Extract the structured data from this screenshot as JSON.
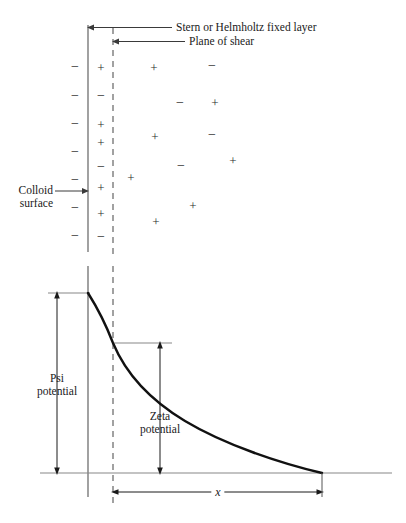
{
  "figure": {
    "title_visible": "",
    "type": "electrical-double-layer-diagram",
    "colors": {
      "curve": "#111111",
      "axis": "#555555",
      "leader": "#3a3a3a",
      "ion": "#2b2b2b",
      "dashed": "#7a7a7a",
      "background": "#ffffff"
    }
  },
  "labels": {
    "stern_layer": "Stern or Helmholtz fixed layer",
    "plane_of_shear": "Plane of shear",
    "colloid_surface_line1": "Colloid",
    "colloid_surface_line2": "surface",
    "psi_line1": "Psi",
    "psi_line2": "potential",
    "zeta_line1": "Zeta",
    "zeta_line2": "potential",
    "x_axis": "x"
  },
  "chart_data": {
    "type": "line",
    "xlabel": "x",
    "ylabel": "potential",
    "grid": false,
    "legend": null,
    "annotations": [
      "Stern or Helmholtz fixed layer",
      "Plane of shear",
      "Colloid surface",
      "Psi potential",
      "Zeta potential"
    ],
    "markers": {
      "colloid_surface_x": 88,
      "plane_of_shear_x": 113,
      "baseline_y": 473,
      "psi_top_y": 293,
      "zeta_top_y": 343,
      "curve_end_x": 322
    },
    "series": [
      {
        "name": "potential",
        "x": [
          88,
          96,
          104,
          113,
          124,
          137,
          152,
          170,
          190,
          212,
          236,
          262,
          290,
          322
        ],
        "y": [
          293,
          304,
          316,
          343,
          360,
          376,
          391,
          404,
          416,
          427,
          438,
          449,
          461,
          473
        ]
      }
    ],
    "psi_potential": {
      "from_y": 293,
      "to_y": 473,
      "value_note": "full surface potential"
    },
    "zeta_potential": {
      "from_y": 343,
      "to_y": 473,
      "value_note": "potential at plane of shear"
    }
  },
  "ion_columns": {
    "surface_negative_label": "−",
    "stern_label_plus": "+",
    "stern_label_minus": "−",
    "surface_charges": [
      {
        "sign": "−",
        "x": 75,
        "y": 67
      },
      {
        "sign": "−",
        "x": 75,
        "y": 96
      },
      {
        "sign": "−",
        "x": 75,
        "y": 124
      },
      {
        "sign": "−",
        "x": 75,
        "y": 152
      },
      {
        "sign": "−",
        "x": 75,
        "y": 180
      },
      {
        "sign": "−",
        "x": 75,
        "y": 208
      },
      {
        "sign": "−",
        "x": 75,
        "y": 236
      }
    ],
    "stern_charges": [
      {
        "sign": "+",
        "x": 101,
        "y": 67
      },
      {
        "sign": "−",
        "x": 101,
        "y": 96
      },
      {
        "sign": "+",
        "x": 101,
        "y": 124
      },
      {
        "sign": "+",
        "x": 101,
        "y": 142
      },
      {
        "sign": "−",
        "x": 101,
        "y": 167
      },
      {
        "sign": "+",
        "x": 101,
        "y": 187
      },
      {
        "sign": "+",
        "x": 101,
        "y": 213
      },
      {
        "sign": "−",
        "x": 101,
        "y": 237
      }
    ],
    "diffuse_charges": [
      {
        "sign": "+",
        "x": 154,
        "y": 67
      },
      {
        "sign": "−",
        "x": 212,
        "y": 66
      },
      {
        "sign": "−",
        "x": 180,
        "y": 103
      },
      {
        "sign": "+",
        "x": 215,
        "y": 102
      },
      {
        "sign": "+",
        "x": 155,
        "y": 136
      },
      {
        "sign": "−",
        "x": 212,
        "y": 135
      },
      {
        "sign": "+",
        "x": 233,
        "y": 160
      },
      {
        "sign": "−",
        "x": 181,
        "y": 166
      },
      {
        "sign": "+",
        "x": 131,
        "y": 177
      },
      {
        "sign": "+",
        "x": 193,
        "y": 205
      },
      {
        "sign": "+",
        "x": 156,
        "y": 221
      }
    ]
  }
}
